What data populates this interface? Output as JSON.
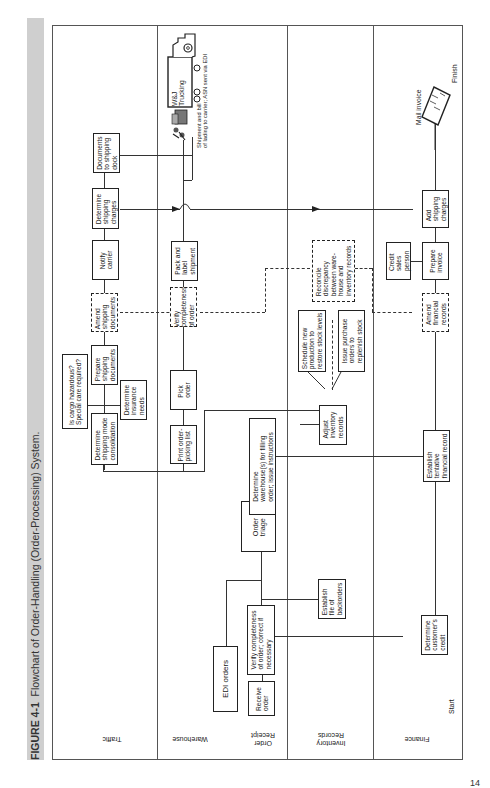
{
  "figure": {
    "label": "FIGURE 4-1",
    "title": "Flowchart of Order-Handling (Order-Processing) System."
  },
  "lanes": [
    {
      "id": "traffic",
      "label": "Traffic"
    },
    {
      "id": "warehouse",
      "label": "Warehouse"
    },
    {
      "id": "order_receipt",
      "label": "Order\nReceipt"
    },
    {
      "id": "inventory",
      "label": "Inventory\nRecords"
    },
    {
      "id": "finance",
      "label": "Finance"
    }
  ],
  "terminals": {
    "start": "Start",
    "finish": "Finish"
  },
  "nodes": {
    "receive_order": "Receive\norder",
    "edi_orders": "EDI orders",
    "verify_order": "Verify completeness\nof order; correct if\nnecessary",
    "establish_backorders": "Establish\nfile of\nbackorders",
    "determine_credit": "Determine\ncustomer's\ncredit",
    "order_triage": "Order\ntriage",
    "determine_warehouse": "Determine\nwarehouse(s) for filling\norder; issue instructions",
    "establish_financial": "Establish\ntentative\nfinancial record",
    "adjust_inventory": "Adjust\ninventory\nrecords",
    "schedule_production": "Schedule new\nproduction to\nrestore stock levels",
    "issue_purchase": "Issue purchase\norders to\nreplenish stock",
    "print_picking": "Print order-\npicking list",
    "pick_order": "Pick\norder",
    "determine_shipping_mode": "Determine\nshipping mode\nconsolidation",
    "cargo_question": "Is cargo hazardous?\nSpecial care required?",
    "prepare_shipping_docs": "Prepare\nshipping\ndocuments",
    "determine_insurance": "Determine\ninsurance\nneeds",
    "amend_shipping_docs": "Amend\nshipping\ndocuments",
    "verify_completeness": "Verify\ncompleteness\nof order",
    "reconcile": "Reconcile\ndiscrepancy\nbetween ware-\nhouse and\ninventory records",
    "amend_financial": "Amend\nfinancial\nrecords",
    "notify_carrier": "Notify\ncarrier",
    "pack_label": "Pack and\nlabel\nshipment",
    "credit_sales": "Credit\nsales\nperson",
    "prepare_invoice": "Prepare\ninvoice",
    "determine_shipping_charges": "Determine\nshipping\ncharges",
    "add_shipping_charges": "Add\nshipping\ncharges",
    "documents_dock": "Documents\nto shipping\ndock",
    "trucking": "W&J\nTrucking",
    "shipment_note": "Shipment and bill\nof lading to carrier; ASN sent via EDI",
    "mail_invoice": "Mail invoice"
  },
  "page_number": "14"
}
